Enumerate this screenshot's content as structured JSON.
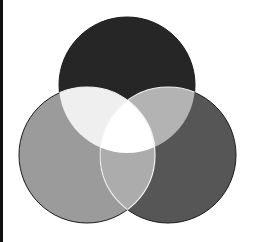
{
  "diagram": {
    "type": "venn",
    "set_count": 3,
    "circles": [
      {
        "id": "top",
        "cx": 127,
        "cy": 85,
        "r": 68,
        "fill": "#262626"
      },
      {
        "id": "left",
        "cx": 87,
        "cy": 155,
        "r": 68,
        "fill": "#9b9b9b"
      },
      {
        "id": "right",
        "cx": 168,
        "cy": 155,
        "r": 68,
        "fill": "#565656"
      }
    ],
    "overlaps": {
      "top_left": "#efefef",
      "top_right": "#b3b3b3",
      "left_right": "#acacac",
      "center": "#ffffff"
    },
    "outline_color": "#1a1a1a",
    "overlap_outline_color": "#f4f4f4",
    "left_bar_color": "#111111"
  }
}
